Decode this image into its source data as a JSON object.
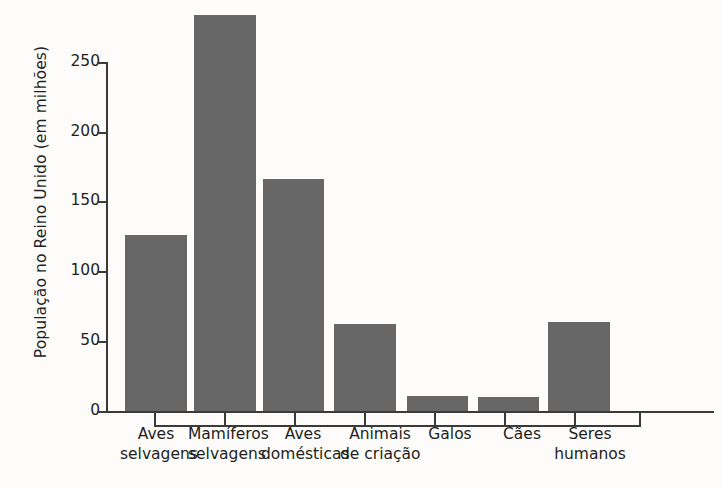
{
  "chart_data": {
    "type": "bar",
    "title": "",
    "xlabel": "",
    "ylabel": "População no Reino Unido (em milhões)",
    "categories": [
      "Aves selvagens",
      "Mamíferos selvagens",
      "Aves domésticas",
      "Animais de criação",
      "Galos",
      "Cães",
      "Seres humanos"
    ],
    "category_lines": [
      [
        "Aves",
        "selvagens"
      ],
      [
        "Mamíferos",
        "selvagens"
      ],
      [
        "Aves",
        "domésticas"
      ],
      [
        "Animais",
        "de criação"
      ],
      [
        "Galos",
        ""
      ],
      [
        "Cães",
        ""
      ],
      [
        "Seres",
        "humanos"
      ]
    ],
    "values": [
      126,
      284,
      166,
      62,
      11,
      10,
      64
    ],
    "ylim": [
      0,
      290
    ],
    "yticks": [
      0,
      50,
      100,
      150,
      200,
      250
    ],
    "ytick_labels": [
      "0",
      "50",
      "100",
      "150",
      "200",
      "250"
    ],
    "grid": false,
    "legend": "none",
    "bar_color": "#676767",
    "axis_color": "#3c3a39",
    "background_color": "#fdfcfb"
  },
  "axis": {
    "tick_0": "0",
    "tick_50": "50",
    "tick_100": "100",
    "tick_150": "150",
    "tick_200": "200",
    "tick_250": "250"
  }
}
